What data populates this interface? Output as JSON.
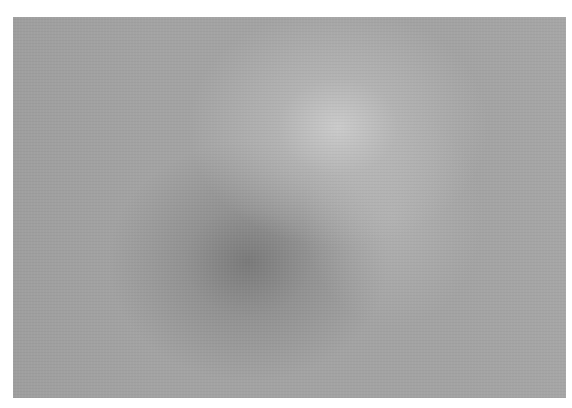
{
  "image": {
    "description": "Blurred grayscale sphere on a gray background with a white border",
    "colors": {
      "border": "#ffffff",
      "background": "#a3a3a3",
      "highlight": "#cdcdcd",
      "shadow": "#737373"
    }
  }
}
